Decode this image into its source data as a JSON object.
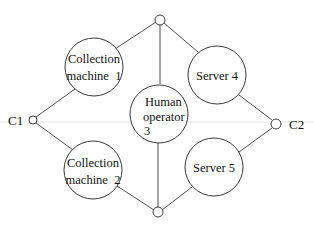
{
  "diagram": {
    "type": "network-graph",
    "terminals": [
      {
        "id": "C1",
        "label": "C1"
      },
      {
        "id": "C2",
        "label": "C2"
      }
    ],
    "nodes": [
      {
        "id": "cm1",
        "line1": "Collection",
        "line2": "machine  1"
      },
      {
        "id": "cm2",
        "line1": "Collection",
        "line2": "machine  2"
      },
      {
        "id": "ho3",
        "line1": "Human",
        "line2": "operator",
        "line3": "3"
      },
      {
        "id": "s4",
        "line1": "Server 4"
      },
      {
        "id": "s5",
        "line1": "Server 5"
      }
    ],
    "junctions": [
      {
        "id": "top"
      },
      {
        "id": "bottom"
      }
    ],
    "edges": [
      {
        "from": "C1",
        "to": "cm1"
      },
      {
        "from": "cm1",
        "to": "top"
      },
      {
        "from": "C1",
        "to": "cm2"
      },
      {
        "from": "cm2",
        "to": "bottom"
      },
      {
        "from": "top",
        "to": "ho3"
      },
      {
        "from": "ho3",
        "to": "bottom"
      },
      {
        "from": "top",
        "to": "s4"
      },
      {
        "from": "s4",
        "to": "C2"
      },
      {
        "from": "bottom",
        "to": "s5"
      },
      {
        "from": "s5",
        "to": "C2"
      }
    ]
  }
}
